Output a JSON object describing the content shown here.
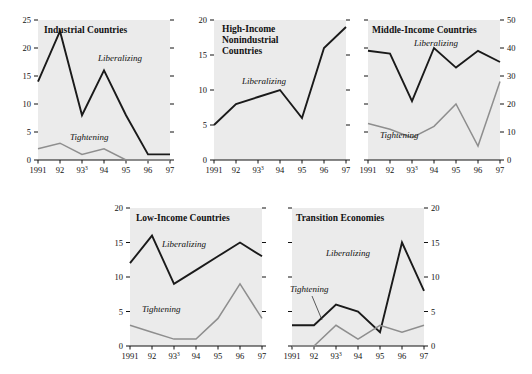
{
  "chart_data": {
    "type": "line",
    "title": "",
    "xlabel": "",
    "ylabel": "",
    "grid": false,
    "legend_position": "inline-annotations",
    "x": [
      "1991",
      "92",
      "93",
      "94",
      "95",
      "96",
      "97"
    ],
    "x_tick_labels": [
      "1991",
      "92",
      "93³",
      "94",
      "95",
      "96",
      "97"
    ],
    "series_names": [
      "Liberalizing",
      "Tightening"
    ],
    "panels": [
      {
        "id": "industrial-countries",
        "title": "Industrial Countries",
        "axis_side": "left",
        "ylim": [
          0,
          25
        ],
        "yticks": [
          0,
          5,
          10,
          15,
          20,
          25
        ],
        "ytick_labels": [
          "0",
          "5",
          "10",
          "15",
          "20",
          "25"
        ],
        "series": [
          {
            "name": "Liberalizing",
            "values": [
              14,
              23,
              8,
              16,
              8,
              1,
              1
            ],
            "label": "Liberalizing"
          },
          {
            "name": "Tightening",
            "values": [
              2,
              3,
              1,
              2,
              0,
              0,
              0
            ],
            "label": "Tightening"
          }
        ]
      },
      {
        "id": "high-income-nonindustrial-countries",
        "title": "High-Income Nonindustrial Countries",
        "title_lines": [
          "High-Income",
          "Nonindustrial",
          "Countries"
        ],
        "axis_side": "left",
        "ylim": [
          0,
          20
        ],
        "yticks": [
          0,
          5,
          10,
          15,
          20
        ],
        "ytick_labels": [
          "0",
          "5",
          "10",
          "15",
          "20"
        ],
        "series": [
          {
            "name": "Liberalizing",
            "values": [
              5,
              8,
              9,
              10,
              6,
              16,
              19
            ],
            "label": "Liberalizing"
          }
        ]
      },
      {
        "id": "middle-income-countries",
        "title": "Middle-Income Countries",
        "axis_side": "right",
        "ylim": [
          0,
          50
        ],
        "yticks": [
          0,
          10,
          20,
          30,
          40,
          50
        ],
        "ytick_labels": [
          "0",
          "10",
          "20",
          "30",
          "40",
          "50"
        ],
        "series": [
          {
            "name": "Liberalizing",
            "values": [
              39,
              38,
              21,
              40,
              33,
              39,
              35
            ],
            "label": "Liberalizing"
          },
          {
            "name": "Tightening",
            "values": [
              13,
              11,
              8,
              12,
              20,
              5,
              28
            ],
            "label": "Tightening"
          }
        ]
      },
      {
        "id": "low-income-countries",
        "title": "Low-Income Countries",
        "axis_side": "left",
        "ylim": [
          0,
          20
        ],
        "yticks": [
          0,
          5,
          10,
          15,
          20
        ],
        "ytick_labels": [
          "0",
          "5",
          "10",
          "15",
          "20"
        ],
        "series": [
          {
            "name": "Liberalizing",
            "values": [
              12,
              16,
              9,
              11,
              13,
              15,
              13
            ],
            "label": "Liberalizing"
          },
          {
            "name": "Tightening",
            "values": [
              3,
              2,
              1,
              1,
              4,
              9,
              4
            ],
            "label": "Tightening"
          }
        ]
      },
      {
        "id": "transition-economies",
        "title": "Transition Economies",
        "axis_side": "right",
        "ylim": [
          0,
          20
        ],
        "yticks": [
          0,
          5,
          10,
          15,
          20
        ],
        "ytick_labels": [
          "0",
          "5",
          "10",
          "15",
          "20"
        ],
        "series": [
          {
            "name": "Liberalizing",
            "values": [
              3,
              3,
              6,
              5,
              2,
              15,
              8
            ],
            "label": "Liberalizing"
          },
          {
            "name": "Tightening",
            "values": [
              0,
              0,
              3,
              1,
              3,
              2,
              3
            ],
            "label": "Tightening"
          }
        ]
      }
    ],
    "colors": {
      "liberalizing": "#1a1a1a",
      "tightening": "#8e8e8e",
      "plot_background": "#ebebeb",
      "axis": "#111111",
      "figure_background": "#ffffff"
    }
  }
}
